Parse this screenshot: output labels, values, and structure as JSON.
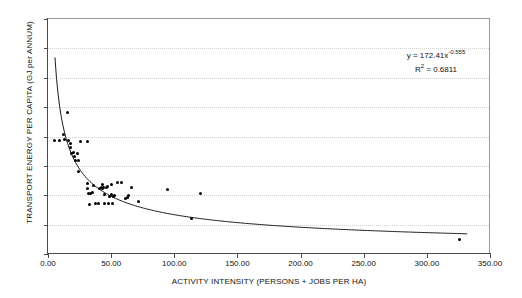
{
  "chart_data": {
    "type": "scatter",
    "title": "",
    "xlabel": "ACTIVITY INTENSITY (PERSONS + JOBS PER HA)",
    "ylabel": "TRANSPORT ENERGY PER CAPITA (GJ per ANNUM)",
    "xlim": [
      0,
      350
    ],
    "ylim": [
      0,
      80
    ],
    "xticks": [
      0,
      50,
      100,
      150,
      200,
      250,
      300,
      350
    ],
    "xtick_labels": [
      "0.00",
      "50.00",
      "100.00",
      "150.00",
      "200.00",
      "250.00",
      "300.00",
      "350.00"
    ],
    "yticks": [
      0,
      10,
      20,
      30,
      40,
      50,
      60,
      70,
      80
    ],
    "ytick_labels": [
      "0",
      "10",
      "20",
      "30",
      "40",
      "50",
      "60",
      "70",
      "80"
    ],
    "grid": "horizontal-dotted",
    "legend": "none",
    "marker_color": "#000000",
    "curve_color": "#1a1a1a",
    "grid_color": "#d2d2d2",
    "axis_color": "#4a4a4a",
    "annotation": {
      "equation_prefix": "y = 172.41x",
      "equation_exponent": "-0.555",
      "r2_prefix": "R",
      "r2_exponent": "2",
      "r2_value": " = 0.6811"
    },
    "fit": {
      "form": "power",
      "a": 172.41,
      "b": -0.555,
      "r2": 0.6811,
      "x_start": 5.5,
      "x_end": 332
    },
    "points": [
      [
        5.5,
        38.8
      ],
      [
        9.5,
        38.8
      ],
      [
        12.5,
        40.8
      ],
      [
        13.0,
        39.0
      ],
      [
        15.5,
        48.3
      ],
      [
        16.5,
        38.5
      ],
      [
        17.5,
        37.5
      ],
      [
        18.0,
        36.3
      ],
      [
        19.0,
        34.3
      ],
      [
        20.0,
        34.6
      ],
      [
        21.0,
        33.3
      ],
      [
        22.0,
        32.0
      ],
      [
        23.0,
        34.1
      ],
      [
        24.0,
        31.9
      ],
      [
        24.5,
        28.0
      ],
      [
        26.0,
        38.2
      ],
      [
        31.5,
        38.2
      ],
      [
        31.0,
        24.0
      ],
      [
        31.5,
        22.3
      ],
      [
        32.0,
        20.6
      ],
      [
        32.5,
        16.9
      ],
      [
        34.0,
        20.5
      ],
      [
        35.0,
        21.0
      ],
      [
        36.0,
        23.3
      ],
      [
        38.0,
        17.2
      ],
      [
        40.0,
        17.2
      ],
      [
        41.0,
        22.2
      ],
      [
        42.0,
        22.6
      ],
      [
        43.0,
        23.5
      ],
      [
        43.5,
        22.4
      ],
      [
        44.0,
        22.7
      ],
      [
        44.5,
        17.3
      ],
      [
        45.0,
        20.1
      ],
      [
        46.0,
        22.6
      ],
      [
        47.0,
        22.9
      ],
      [
        48.0,
        17.3
      ],
      [
        49.0,
        19.6
      ],
      [
        50.0,
        20.1
      ],
      [
        50.5,
        23.6
      ],
      [
        51.0,
        17.1
      ],
      [
        52.0,
        19.5
      ],
      [
        53.0,
        20.0
      ],
      [
        55.0,
        24.4
      ],
      [
        58.5,
        24.4
      ],
      [
        61.0,
        19.0
      ],
      [
        63.0,
        19.2
      ],
      [
        64.0,
        20.0
      ],
      [
        66.0,
        22.8
      ],
      [
        71.5,
        17.8
      ],
      [
        94.5,
        22.0
      ],
      [
        113.5,
        12.0
      ],
      [
        120.5,
        20.6
      ],
      [
        325.5,
        4.8
      ]
    ]
  }
}
